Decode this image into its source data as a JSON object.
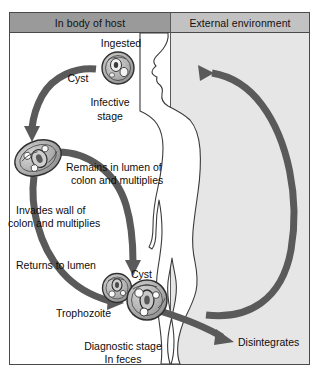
{
  "diagram": {
    "title_headers": {
      "host": "In body of host",
      "environment": "External environment"
    },
    "colors": {
      "arrow": "#5a5a5a",
      "host_header_bg": "#9a9a9a",
      "env_header_bg": "#c2c2c2",
      "env_panel_bg": "#e6e6e6",
      "border": "#4a4a4a",
      "cell_fill": "#b8b8b8",
      "body_outline": "#3a3a3a"
    },
    "labels": {
      "ingested": "Ingested",
      "cyst_top": "Cyst",
      "infective_stage_line1": "Infective",
      "infective_stage_line2": "stage",
      "remains_line1": "Remains in lumen of",
      "remains_line2": "colon and multiplies",
      "invades_line1": "Invades wall of",
      "invades_line2": "colon and multiplies",
      "returns_to_lumen": "Returns to lumen",
      "cyst_bottom": "Cyst",
      "trophozoite": "Trophozoite",
      "diagnostic_line1": "Diagnostic stage",
      "diagnostic_line2": "In feces",
      "disintegrates": "Disintegrates"
    },
    "organisms": [
      {
        "name": "ingested-cyst",
        "type": "cyst",
        "shape": "round"
      },
      {
        "name": "colon-trophozoite",
        "type": "trophozoite",
        "shape": "oval"
      },
      {
        "name": "lumen-trophozoite",
        "type": "trophozoite",
        "shape": "round"
      },
      {
        "name": "feces-cyst",
        "type": "cyst",
        "shape": "round"
      }
    ]
  }
}
